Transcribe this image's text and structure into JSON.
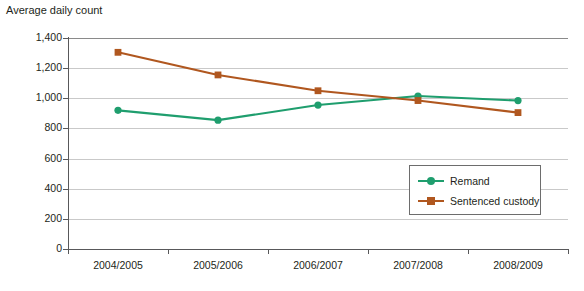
{
  "chart_data": {
    "type": "line",
    "title": "",
    "ylabel": "Average daily count",
    "xlabel": "",
    "categories": [
      "2004/2005",
      "2005/2006",
      "2006/2007",
      "2007/2008",
      "2008/2009"
    ],
    "series": [
      {
        "name": "Remand",
        "color": "#1f9e6e",
        "marker": "circle",
        "values": [
          920,
          855,
          955,
          1015,
          985
        ]
      },
      {
        "name": "Sentenced custody",
        "color": "#b0571f",
        "marker": "square",
        "values": [
          1305,
          1155,
          1050,
          985,
          905
        ]
      }
    ],
    "ylim": [
      0,
      1400
    ],
    "ytick_values": [
      0,
      200,
      400,
      600,
      800,
      1000,
      1200,
      1400
    ],
    "ytick_labels": [
      "0",
      "200",
      "400",
      "600",
      "800",
      "1,000",
      "1,200",
      "1,400"
    ],
    "grid": true,
    "legend_position": "inside-bottom-right"
  },
  "axis": {
    "y_title": "Average daily count"
  },
  "legend": {
    "entries": [
      {
        "label": "Remand"
      },
      {
        "label": "Sentenced custody"
      }
    ]
  },
  "colors": {
    "remand": "#1f9e6e",
    "sentenced_custody": "#b0571f",
    "gridline": "#c9c9c9",
    "axis": "#58585a",
    "text": "#231f20",
    "background": "#ffffff"
  }
}
